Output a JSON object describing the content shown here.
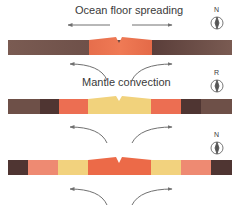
{
  "title": "Ocean floor spreading",
  "subtitle": "Mantle convection",
  "colors": {
    "old_crust": "#6e5048",
    "dark_crust": "#4f3532",
    "red_band": "#e96a48",
    "salmon_band": "#ee8a72",
    "yellow_band": "#f2d27e",
    "arrow": "#707070"
  },
  "stages": [
    {
      "compass_letter": "N",
      "bands": [
        "old_crust",
        "red_band",
        "old_crust"
      ]
    },
    {
      "compass_letter": "R",
      "bands": [
        "old_crust",
        "dark_crust",
        "salmon_band",
        "yellow_band",
        "salmon_band",
        "dark_crust",
        "old_crust"
      ]
    },
    {
      "compass_letter": "N",
      "bands": [
        "dark_crust",
        "salmon_band",
        "yellow_band",
        "red_band",
        "yellow_band",
        "salmon_band",
        "dark_crust"
      ]
    }
  ]
}
